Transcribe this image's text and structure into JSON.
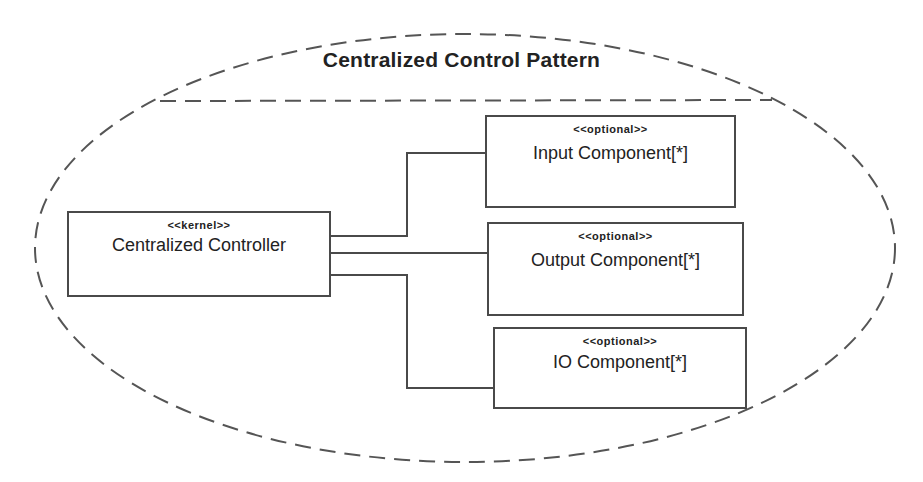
{
  "diagram": {
    "type": "uml-component-pattern",
    "title": "Centralized Control Pattern",
    "components": [
      {
        "id": "controller",
        "stereotype": "<<kernel>>",
        "name": "Centralized Controller"
      },
      {
        "id": "input",
        "stereotype": "<<optional>>",
        "name": "Input Component[*]"
      },
      {
        "id": "output",
        "stereotype": "<<optional>>",
        "name": "Output Component[*]"
      },
      {
        "id": "io",
        "stereotype": "<<optional>>",
        "name": "IO Component[*]"
      }
    ],
    "connections": [
      {
        "from": "controller",
        "to": "input"
      },
      {
        "from": "controller",
        "to": "output"
      },
      {
        "from": "controller",
        "to": "io"
      }
    ],
    "colors": {
      "line": "#4a4a4a",
      "text": "#222222",
      "background": "#ffffff"
    }
  }
}
